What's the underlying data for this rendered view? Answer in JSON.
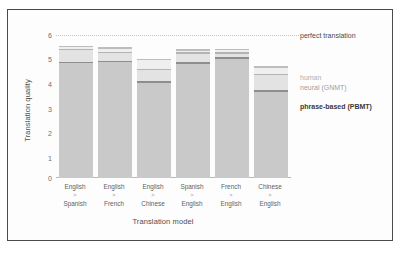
{
  "chart_data": {
    "type": "bar",
    "title": "",
    "xlabel": "Translation model",
    "ylabel": "Translation quality",
    "ylim": [
      0,
      6
    ],
    "yticks": [
      "0",
      "1",
      "2",
      "3",
      "4",
      "5",
      "6"
    ],
    "grid": false,
    "legend_position": "right",
    "stacked": true,
    "categories": [
      "English > Spanish",
      "English > French",
      "English > Chinese",
      "Spanish > English",
      "French > English",
      "Chinese > English"
    ],
    "category_parts": [
      {
        "from": "English",
        "arrow": ">",
        "to": "Spanish"
      },
      {
        "from": "English",
        "arrow": ">",
        "to": "French"
      },
      {
        "from": "English",
        "arrow": ">",
        "to": "Chinese"
      },
      {
        "from": "Spanish",
        "arrow": ">",
        "to": "English"
      },
      {
        "from": "French",
        "arrow": ">",
        "to": "English"
      },
      {
        "from": "Chinese",
        "arrow": ">",
        "to": "English"
      }
    ],
    "series": [
      {
        "name": "phrase-based (PBMT)",
        "values": [
          4.88,
          4.93,
          4.07,
          4.87,
          5.06,
          3.69
        ],
        "color": "#c9c9c9"
      },
      {
        "name": "neural (GNMT)",
        "values": [
          5.43,
          5.3,
          4.59,
          5.28,
          5.29,
          4.38
        ],
        "color": "#e3e3e3"
      },
      {
        "name": "human",
        "values": [
          5.55,
          5.5,
          5.0,
          5.41,
          5.42,
          4.68
        ],
        "color": "#efefef"
      }
    ],
    "reference_line": {
      "label": "perfect translation",
      "value": 6.0,
      "style": "dotted"
    },
    "legend": [
      {
        "key": "perfect",
        "label": "perfect translation"
      },
      {
        "key": "human",
        "label": "human"
      },
      {
        "key": "gnmt",
        "label": "neural (GNMT)"
      },
      {
        "key": "pbmt",
        "label": "phrase-based (PBMT)"
      }
    ]
  }
}
